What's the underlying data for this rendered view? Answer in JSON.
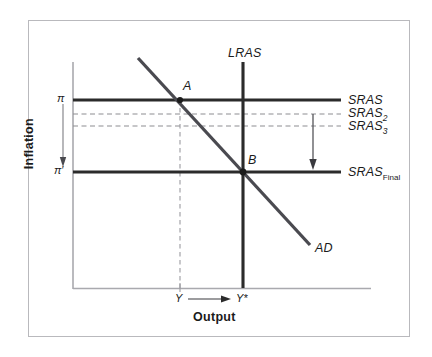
{
  "figure": {
    "type": "economics-ad-as-diagram",
    "background_color": "#ffffff",
    "frame_color": "#b9b9bd",
    "line_color": "#2b2b2b",
    "dash_color": "#8d8d92",
    "axis_color": "#a9a9ae"
  },
  "axes": {
    "y_title": "Inflation",
    "x_title": "Output",
    "y_ticks": [
      {
        "label": "π",
        "position": "top",
        "value_y": 100
      },
      {
        "label": "π′",
        "position": "bottom",
        "value_y": 172
      }
    ],
    "x_ticks": [
      {
        "label": "Y",
        "position_x": 180
      },
      {
        "label": "Y*",
        "position_x": 243
      }
    ],
    "x_arrow": {
      "from_label": "Y",
      "to_label": "Y*",
      "direction": "right"
    },
    "y_arrow": {
      "from_label": "π",
      "to_label": "π′",
      "direction": "down"
    }
  },
  "curves": [
    {
      "name": "SRAS",
      "label": "SRAS",
      "subscript": "",
      "style": "solid",
      "weight": "thick",
      "orientation": "horizontal",
      "y": 100
    },
    {
      "name": "SRAS2",
      "label": "SRAS",
      "subscript": "2",
      "style": "dashed",
      "weight": "thin",
      "orientation": "horizontal",
      "y": 114
    },
    {
      "name": "SRAS3",
      "label": "SRAS",
      "subscript": "3",
      "style": "dashed",
      "weight": "thin",
      "orientation": "horizontal",
      "y": 126
    },
    {
      "name": "SRASFinal",
      "label": "SRAS",
      "subscript": "Final",
      "style": "solid",
      "weight": "thick",
      "orientation": "horizontal",
      "y": 172
    },
    {
      "name": "LRAS",
      "label": "LRAS",
      "subscript": "",
      "style": "solid",
      "weight": "thick",
      "orientation": "vertical",
      "x": 243
    },
    {
      "name": "AD",
      "label": "AD",
      "subscript": "",
      "style": "solid",
      "weight": "thick",
      "orientation": "downward-sloping",
      "from": [
        138,
        58
      ],
      "to": [
        310,
        245
      ]
    }
  ],
  "points": [
    {
      "label": "A",
      "x": 180,
      "y": 100,
      "description": "AD intersects SRAS"
    },
    {
      "label": "B",
      "x": 243,
      "y": 172,
      "description": "AD intersects LRAS and SRAS-Final"
    }
  ],
  "annotations": [
    {
      "name": "sras-shift-arrow",
      "kind": "vertical-arrow",
      "direction": "down",
      "x": 313,
      "from_y": 114,
      "to_y": 168
    },
    {
      "name": "inflation-fall-arrow",
      "kind": "vertical-arrow",
      "direction": "down",
      "x": 63,
      "from_y": 104,
      "to_y": 166
    },
    {
      "name": "output-gap-dashed-guide",
      "kind": "vertical-dashed",
      "x": 180,
      "from_y": 100,
      "to_y": 288
    }
  ]
}
